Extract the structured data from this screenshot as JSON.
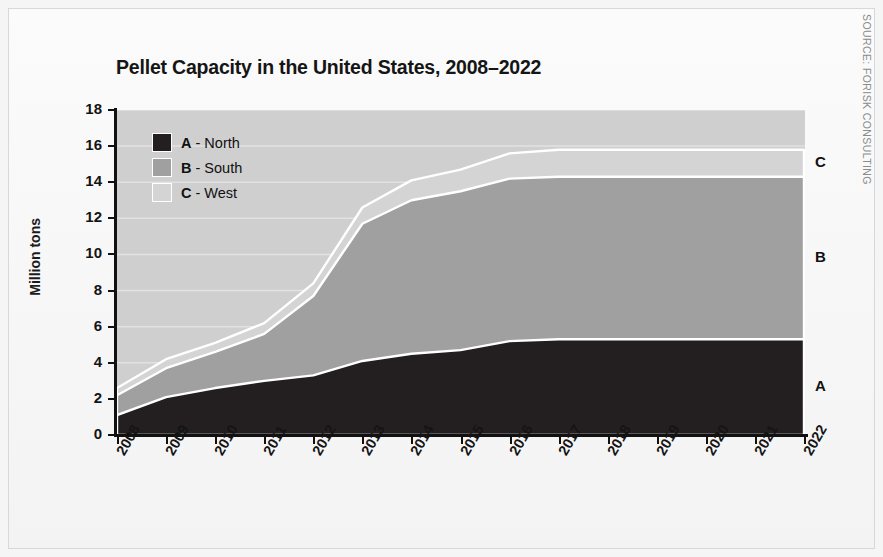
{
  "page": {
    "background_color": "#f5f5f5",
    "source_note": "SOURCE: FORISK CONSULTING"
  },
  "chart_data": {
    "type": "area",
    "stacked": true,
    "title": "Pellet Capacity in the United States, 2008–2022",
    "xlabel": "",
    "ylabel": "Million tons",
    "ylim": [
      0,
      18
    ],
    "ytick_values": [
      0,
      2,
      4,
      6,
      8,
      10,
      12,
      14,
      16,
      18
    ],
    "ytick_labels": [
      "0",
      "2",
      "4",
      "6",
      "8",
      "10",
      "12",
      "14",
      "16",
      "18"
    ],
    "grid": "horizontal-white",
    "legend_position": "upper-left-inside",
    "categories": [
      "2008",
      "2009",
      "2010",
      "2011",
      "2012",
      "2013",
      "2014",
      "2015",
      "2016",
      "2017",
      "2018",
      "2019",
      "2020",
      "2021",
      "2022"
    ],
    "series": [
      {
        "key": "A",
        "name": "North",
        "legend_label": "A - North",
        "color": "#231f20",
        "values": [
          1.1,
          2.1,
          2.6,
          3.0,
          3.3,
          4.1,
          4.5,
          4.7,
          5.2,
          5.3,
          5.3,
          5.3,
          5.3,
          5.3,
          5.3
        ]
      },
      {
        "key": "B",
        "name": "South",
        "legend_label": "B - South",
        "color": "#a0a0a0",
        "values": [
          1.1,
          1.6,
          2.0,
          2.6,
          4.4,
          7.6,
          8.5,
          8.8,
          9.0,
          9.0,
          9.0,
          9.0,
          9.0,
          9.0,
          9.0
        ]
      },
      {
        "key": "C",
        "name": "West",
        "legend_label": "C - West",
        "color": "#d4d4d4",
        "values": [
          0.4,
          0.5,
          0.5,
          0.6,
          0.7,
          0.9,
          1.1,
          1.2,
          1.4,
          1.5,
          1.5,
          1.5,
          1.5,
          1.5,
          1.5
        ]
      }
    ],
    "cumulative_tops": {
      "A": [
        1.1,
        2.1,
        2.6,
        3.0,
        3.3,
        4.1,
        4.5,
        4.7,
        5.2,
        5.3,
        5.3,
        5.3,
        5.3,
        5.3,
        5.3
      ],
      "B": [
        2.2,
        3.7,
        4.6,
        5.6,
        7.7,
        11.7,
        13.0,
        13.5,
        14.2,
        14.3,
        14.3,
        14.3,
        14.3,
        14.3,
        14.3
      ],
      "C": [
        2.6,
        4.2,
        5.1,
        6.2,
        8.4,
        12.6,
        14.1,
        14.7,
        15.6,
        15.8,
        15.8,
        15.8,
        15.8,
        15.8,
        15.8
      ]
    },
    "series_end_labels": [
      {
        "text": "A",
        "series": "North"
      },
      {
        "text": "B",
        "series": "South"
      },
      {
        "text": "C",
        "series": "West"
      }
    ],
    "plot_background": "#cfcfcf",
    "boundary_line_color": "#ffffff"
  }
}
